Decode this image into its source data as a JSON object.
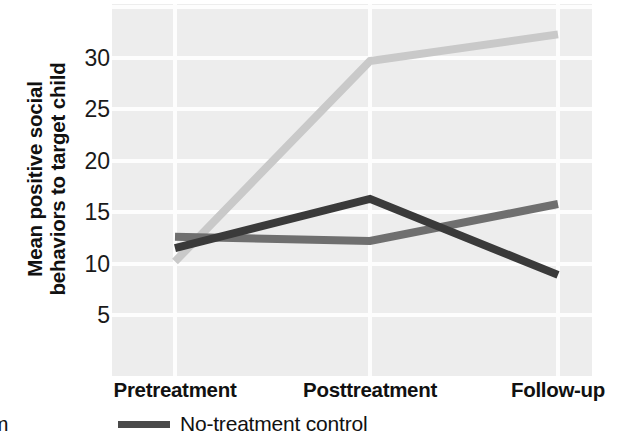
{
  "chart_data": {
    "type": "line",
    "title": "",
    "xlabel": "",
    "ylabel": "Mean positive social behaviors to target child",
    "ylabel_line1": "Mean positive social",
    "ylabel_line2": "behaviors to target child",
    "categories": [
      "Pretreatment",
      "Posttreatment",
      "Follow-up"
    ],
    "ylim": [
      0,
      34
    ],
    "yticks": [
      5,
      10,
      15,
      20,
      25,
      30
    ],
    "ytick_labels": [
      "5",
      "10",
      "15",
      "20",
      "25",
      "30"
    ],
    "grid": true,
    "grid_color": "#fdfdfd",
    "plot_background": "#ededed",
    "legend_position": "bottom",
    "series": [
      {
        "name": "Behavioral film",
        "legend_label": "ral film",
        "color": "#c9c9c9",
        "values": [
          10.2,
          29.7,
          32.3
        ]
      },
      {
        "name": "No-treatment control",
        "legend_label": "No-treatment control",
        "color": "#6f6f6f",
        "values": [
          12.6,
          12.2,
          15.8
        ]
      },
      {
        "name": "Third condition",
        "legend_label": "",
        "color": "#3a3a3a",
        "values": [
          11.5,
          16.3,
          8.9
        ]
      }
    ]
  },
  "legend": {
    "items": [
      {
        "label": "ral film",
        "color": "#6f6f6f",
        "has_swatch": false
      },
      {
        "label": "No-treatment control",
        "color": "#4a4a4a",
        "has_swatch": true
      }
    ]
  }
}
